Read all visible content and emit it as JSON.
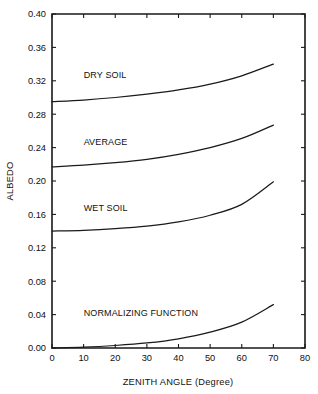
{
  "chart_data": {
    "type": "line",
    "title": "",
    "xlabel": "ZENITH ANGLE (Degree)",
    "ylabel": "ALBEDO",
    "xlim": [
      0,
      80
    ],
    "ylim": [
      0.0,
      0.4
    ],
    "grid": false,
    "legend_position": "inline-labels",
    "xticks": [
      0,
      10,
      20,
      30,
      40,
      50,
      60,
      70,
      80
    ],
    "xtick_labels": [
      "0",
      "10",
      "20",
      "30",
      "40",
      "50",
      "60",
      "70",
      "80"
    ],
    "yticks": [
      0.0,
      0.04,
      0.08,
      0.12,
      0.16,
      0.2,
      0.24,
      0.28,
      0.32,
      0.36,
      0.4
    ],
    "ytick_labels": [
      "0.00",
      "0.04",
      "0.08",
      "0.12",
      "0.16",
      "0.20",
      "0.24",
      "0.28",
      "0.32",
      "0.36",
      "0.40"
    ],
    "x": [
      0,
      10,
      20,
      30,
      40,
      50,
      60,
      70
    ],
    "series": [
      {
        "name": "DRY SOIL",
        "values": [
          0.295,
          0.297,
          0.3,
          0.304,
          0.309,
          0.316,
          0.326,
          0.34
        ],
        "label_x": 10,
        "label_y": 0.323
      },
      {
        "name": "AVERAGE",
        "values": [
          0.217,
          0.219,
          0.222,
          0.226,
          0.232,
          0.24,
          0.251,
          0.267
        ],
        "label_x": 10,
        "label_y": 0.243
      },
      {
        "name": "WET SOIL",
        "values": [
          0.14,
          0.141,
          0.143,
          0.146,
          0.151,
          0.159,
          0.172,
          0.199
        ],
        "label_x": 10,
        "label_y": 0.164
      },
      {
        "name": "NORMALIZING FUNCTION",
        "values": [
          0.0,
          0.001,
          0.003,
          0.006,
          0.011,
          0.019,
          0.031,
          0.052
        ],
        "label_x": 10,
        "label_y": 0.038
      }
    ],
    "colors": {
      "curve": "#1a1a1a",
      "axis": "#1a1a1a",
      "background": "#ffffff"
    }
  }
}
